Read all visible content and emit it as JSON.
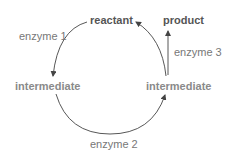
{
  "diagram": {
    "type": "metabolic-cycle",
    "nodes": {
      "reactant": "reactant",
      "product": "product",
      "intermediate_left": "intermediate",
      "intermediate_right": "intermediate"
    },
    "edges": [
      {
        "from": "reactant",
        "to": "intermediate_left",
        "label": "enzyme 1"
      },
      {
        "from": "intermediate_left",
        "to": "intermediate_right",
        "label": "enzyme 2"
      },
      {
        "from": "intermediate_right",
        "to": "reactant",
        "label": ""
      },
      {
        "from": "intermediate_right",
        "to": "product",
        "label": "enzyme 3"
      }
    ],
    "colors": {
      "main_node": "#555555",
      "intermediate_node": "#8a8a8a",
      "enzyme_label": "#777777",
      "arrow": "#444444",
      "background": "#ffffff"
    }
  }
}
